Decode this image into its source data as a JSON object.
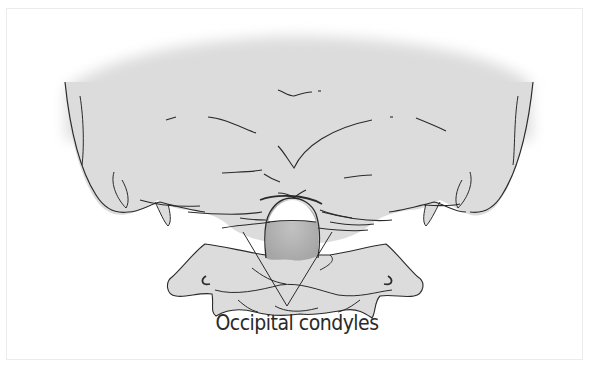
{
  "figure": {
    "label": "Occipital condyles",
    "colors": {
      "bone_fill": "#dcdcdc",
      "foramen_fill": "#b4b4b4",
      "outline": "#2a2a2a",
      "background": "#ffffff",
      "frame": "#ececec"
    }
  }
}
